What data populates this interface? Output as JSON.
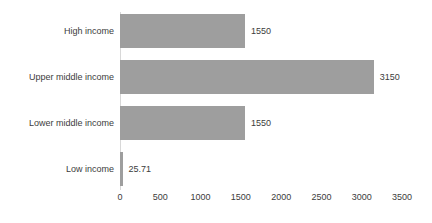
{
  "chart_data": {
    "type": "bar",
    "orientation": "horizontal",
    "title": "",
    "xlabel": "",
    "ylabel": "",
    "categories": [
      "High income",
      "Upper middle income",
      "Lower middle income",
      "Low income"
    ],
    "values": [
      1550,
      3150,
      1550,
      25.71
    ],
    "value_labels": [
      "1550",
      "3150",
      "1550",
      "25.71"
    ],
    "xlim": [
      0,
      3500
    ],
    "xticks": [
      0,
      500,
      1000,
      1500,
      2000,
      2500,
      3000,
      3500
    ],
    "xtick_labels": [
      "0",
      "500",
      "1000",
      "1500",
      "2000",
      "2500",
      "3000",
      "3500"
    ],
    "grid": false,
    "legend": false,
    "bar_color": "#9e9e9e",
    "text_color": "#3c3c3c",
    "background_color": "#ffffff",
    "axis_color": "#d8d8d8"
  }
}
